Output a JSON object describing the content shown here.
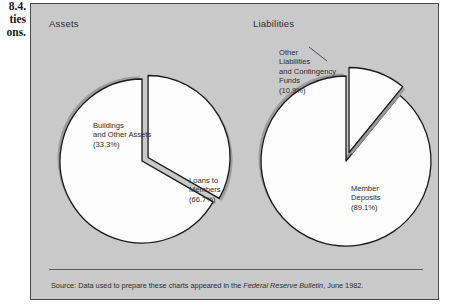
{
  "margin_caption": {
    "lines": [
      "8.4.",
      "ties",
      "ons."
    ]
  },
  "panel": {
    "background": "#c9c9c9",
    "border_color": "#4a4a4a"
  },
  "charts": [
    {
      "title": "Assets",
      "labels": {
        "slice_a": "Buildings\nand Other Assets\n(33.3%)",
        "slice_a_l1": "Buildings",
        "slice_a_l2": "and Other Assets",
        "slice_a_l3": "(33.3%)",
        "slice_b_l1": "Loans to",
        "slice_b_l2": "Members",
        "slice_b_l3": "(66.7%)"
      }
    },
    {
      "title": "Liabilities",
      "labels": {
        "slice_a_l1": "Other",
        "slice_a_l2": "Liabilities",
        "slice_a_l3": "and Contingency",
        "slice_a_l4": "Funds",
        "slice_a_l5": "(10.9%)",
        "slice_b_l1": "Member",
        "slice_b_l2": "Deposits",
        "slice_b_l3": "(89.1%)"
      }
    }
  ],
  "source": {
    "prefix": "Source: Data used to prepare these charts appeared in the ",
    "italic": "Federal Reserve Bulletin",
    "suffix": ", June 1982."
  },
  "chart_data": [
    {
      "type": "pie",
      "title": "Assets",
      "categories": [
        "Loans to Members",
        "Buildings and Other Assets"
      ],
      "values": [
        66.7,
        33.3
      ],
      "units": "percent",
      "labels": [
        "Loans to Members (66.7%)",
        "Buildings and Other Assets (33.3%)"
      ],
      "exploded": [
        "Buildings and Other Assets"
      ],
      "colors": [
        "#fdfdfd",
        "#fdfdfd"
      ],
      "edge_color": "#1a1a1a",
      "shadow_color": "#9a9a9a",
      "start_angle_deg": 90,
      "direction": "counterclockwise",
      "legend": "none",
      "grid": false
    },
    {
      "type": "pie",
      "title": "Liabilities",
      "categories": [
        "Member Deposits",
        "Other Liabilities and Contingency Funds"
      ],
      "values": [
        89.1,
        10.9
      ],
      "units": "percent",
      "labels": [
        "Member Deposits (89.1%)",
        "Other Liabilities and Contingency Funds (10.9%)"
      ],
      "exploded": [
        "Other Liabilities and Contingency Funds"
      ],
      "colors": [
        "#fdfdfd",
        "#fdfdfd"
      ],
      "edge_color": "#1a1a1a",
      "shadow_color": "#9a9a9a",
      "start_angle_deg": 90,
      "direction": "counterclockwise",
      "legend": "none",
      "grid": false
    }
  ]
}
